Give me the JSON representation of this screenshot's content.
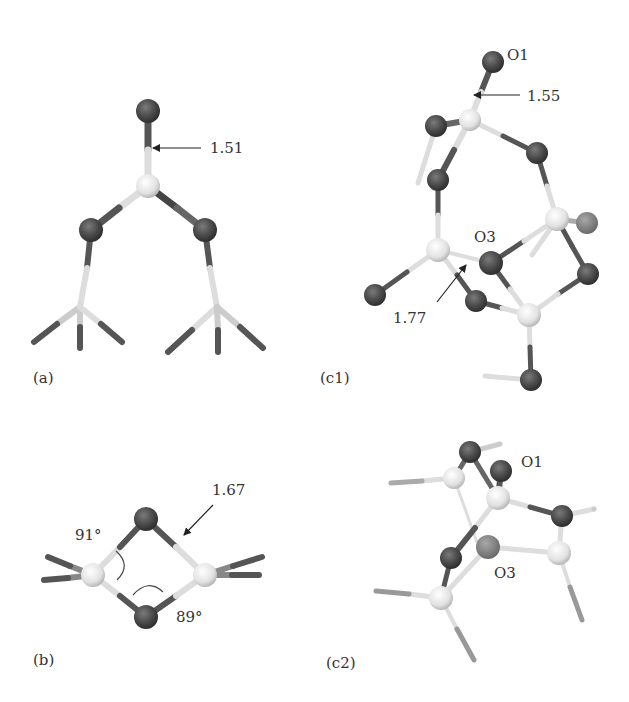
{
  "figure": {
    "type": "molecular-structure-diagram",
    "panels": [
      {
        "id": "a",
        "label": "(a)",
        "annotations": [
          {
            "kind": "bond-length",
            "text": "1.51"
          }
        ]
      },
      {
        "id": "b",
        "label": "(b)",
        "annotations": [
          {
            "kind": "bond-length",
            "text": "1.67"
          },
          {
            "kind": "angle",
            "text": "91°"
          },
          {
            "kind": "angle",
            "text": "89°"
          }
        ]
      },
      {
        "id": "c1",
        "label": "(c1)",
        "annotations": [
          {
            "kind": "atom-label",
            "text": "O1"
          },
          {
            "kind": "bond-length",
            "text": "1.55"
          },
          {
            "kind": "atom-label",
            "text": "O3"
          },
          {
            "kind": "bond-length",
            "text": "1.77"
          }
        ]
      },
      {
        "id": "c2",
        "label": "(c2)",
        "annotations": [
          {
            "kind": "atom-label",
            "text": "O1"
          },
          {
            "kind": "atom-label",
            "text": "O3"
          }
        ]
      }
    ],
    "colors": {
      "oxygen": "#4a4a4a",
      "silicon": "#e6e6e6",
      "bond_dark": "#555555",
      "bond_light": "#d8d8d8",
      "text": "#333333"
    }
  }
}
